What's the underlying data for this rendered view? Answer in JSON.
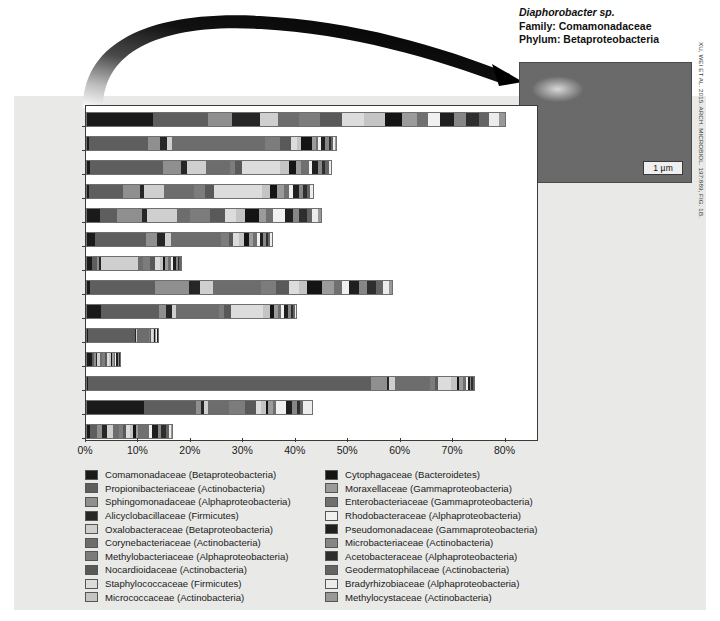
{
  "figure": {
    "callout": {
      "species": "Diaphorobacter sp.",
      "family": "Family: Comamonadaceae",
      "phylum": "Phylum: Betaproteobacteria",
      "scale_bar": "1 µm",
      "credit": "XU, WEI ET AL. 2015. ARCH. MICROBIOL. 197:889, FIG. 1B."
    }
  },
  "chart_data": {
    "type": "bar",
    "orientation": "horizontal",
    "stacked": true,
    "title": "",
    "xlabel": "",
    "ylabel": "",
    "xlim": [
      0,
      86
    ],
    "grid": false,
    "legend_position": "bottom",
    "tick_labels": [
      "0%",
      "10%",
      "20%",
      "30%",
      "40%",
      "50%",
      "60%",
      "70%",
      "80%"
    ],
    "tick_values": [
      0,
      10,
      20,
      30,
      40,
      50,
      60,
      70,
      80
    ],
    "categories": [
      "Indoor air",
      "Bathtub tiles",
      "Carpet",
      "Countertop",
      "Doorstep",
      "Floor",
      "Refrigerator",
      "Outdoor air",
      "Pet",
      "Saliva",
      "Showerhead",
      "Skin",
      "Tap water",
      "Toilet"
    ],
    "series": [
      {
        "name": "Comamonadaceae (Betaproteobacteria)",
        "color": "#1a1a1a",
        "values": [
          12.5,
          0.4,
          0.5,
          0.3,
          2.5,
          1.6,
          1.0,
          0.6,
          2.6,
          0.2,
          1.0,
          0.2,
          10.8,
          0.5
        ]
      },
      {
        "name": "Propionibacteriaceae (Actinobacteria)",
        "color": "#5e5e5e",
        "values": [
          10.6,
          11.2,
          14.0,
          6.6,
          3.3,
          9.6,
          0.9,
          12.3,
          11.1,
          8.9,
          0.4,
          54.0,
          9.9,
          1.5
        ]
      },
      {
        "name": "Sphingomonadaceae (Alphaproteobacteria)",
        "color": "#8f8f8f",
        "values": [
          4.6,
          2.4,
          3.4,
          3.3,
          4.7,
          2.1,
          0.4,
          6.6,
          1.4,
          0.0,
          0.3,
          3.0,
          1.0,
          0.8
        ]
      },
      {
        "name": "Alicyclobacillaceae (Firmicutes)",
        "color": "#262626",
        "values": [
          5.2,
          1.2,
          1.1,
          0.6,
          1.0,
          1.5,
          0.3,
          2.1,
          1.1,
          0.2,
          0.2,
          0.4,
          0.6,
          1.0
        ]
      },
      {
        "name": "Oxalobacteraceae (Betaproteobacteria)",
        "color": "#cfcfcf",
        "values": [
          3.5,
          1.0,
          3.7,
          3.8,
          5.7,
          1.3,
          7.2,
          2.5,
          0.8,
          0.2,
          0.5,
          1.2,
          0.7,
          1.2
        ]
      },
      {
        "name": "Corynebacteriaceae (Actinobacteria)",
        "color": "#6d6d6d",
        "values": [
          4.0,
          17.7,
          4.6,
          5.8,
          2.4,
          9.5,
          0.8,
          9.1,
          8.2,
          2.4,
          0.4,
          6.6,
          4.0,
          1.1
        ]
      },
      {
        "name": "Methylobacteriaceae (Alphaproteobacteria)",
        "color": "#7c7c7c",
        "values": [
          4.1,
          3.0,
          1.0,
          2.2,
          3.8,
          1.4,
          1.4,
          2.9,
          1.0,
          0.2,
          0.6,
          1.0,
          3.2,
          0.8
        ]
      },
      {
        "name": "Nocardioidaceae (Actinobacteria)",
        "color": "#595959",
        "values": [
          4.2,
          2.0,
          1.2,
          1.7,
          2.9,
          0.8,
          0.9,
          2.4,
          1.2,
          0.2,
          0.4,
          0.6,
          2.0,
          0.6
        ]
      },
      {
        "name": "Staphylococcaceae (Firmicutes)",
        "color": "#dcdcdc",
        "values": [
          4.2,
          1.1,
          7.4,
          9.1,
          2.2,
          1.2,
          1.0,
          2.0,
          6.2,
          0.3,
          0.4,
          2.5,
          1.0,
          0.7
        ]
      },
      {
        "name": "Micrococcaceae (Actinobacteria)",
        "color": "#c4c4c4",
        "values": [
          4.0,
          0.8,
          1.7,
          1.6,
          1.6,
          1.0,
          0.6,
          1.4,
          1.3,
          0.2,
          0.3,
          1.0,
          0.9,
          0.5
        ]
      },
      {
        "name": "Cytophagaceae (Bacteroidetes)",
        "color": "#141414",
        "values": [
          3.2,
          2.1,
          1.3,
          1.2,
          2.7,
          0.9,
          0.4,
          3.0,
          0.7,
          0.1,
          0.3,
          0.5,
          0.5,
          0.6
        ]
      },
      {
        "name": "Moraxellaceae (Gammaproteobacteria)",
        "color": "#9b9b9b",
        "values": [
          2.8,
          0.7,
          1.0,
          1.3,
          1.4,
          0.8,
          0.6,
          2.2,
          0.8,
          0.2,
          0.3,
          0.7,
          0.8,
          0.5
        ]
      },
      {
        "name": "Enterobacteriaceae (Gammaproteobacteria)",
        "color": "#707070",
        "values": [
          2.1,
          0.5,
          1.4,
          1.0,
          1.2,
          0.7,
          0.5,
          1.6,
          0.6,
          0.1,
          0.3,
          0.5,
          0.7,
          2.0
        ]
      },
      {
        "name": "Rhodobacteraceae (Alphaproteobacteria)",
        "color": "#f0f0f0",
        "values": [
          2.4,
          0.6,
          0.6,
          0.8,
          2.3,
          0.6,
          0.4,
          1.2,
          0.5,
          0.1,
          0.2,
          0.4,
          1.8,
          0.6
        ]
      },
      {
        "name": "Pseudomonadaceae (Gammaproteobacteria)",
        "color": "#1f1f1f",
        "values": [
          2.6,
          0.8,
          1.1,
          1.1,
          1.6,
          0.6,
          0.5,
          2.0,
          0.9,
          0.2,
          0.3,
          0.4,
          1.2,
          1.1
        ]
      },
      {
        "name": "Microbacteriaceae (Actinobacteria)",
        "color": "#868686",
        "values": [
          2.2,
          0.6,
          0.8,
          0.9,
          1.1,
          0.5,
          0.4,
          1.5,
          0.5,
          0.1,
          0.2,
          0.3,
          0.9,
          0.7
        ]
      },
      {
        "name": "Acetobacteraceae (Alphaproteobacteria)",
        "color": "#2e2e2e",
        "values": [
          2.5,
          0.5,
          0.7,
          0.7,
          1.5,
          0.5,
          0.3,
          1.8,
          0.4,
          0.1,
          0.2,
          0.3,
          0.7,
          0.9
        ]
      },
      {
        "name": "Geodermatophilaceae (Actinobacteria)",
        "color": "#646464",
        "values": [
          2.0,
          0.4,
          0.6,
          0.6,
          1.0,
          0.4,
          0.3,
          1.3,
          0.4,
          0.1,
          0.2,
          0.2,
          0.6,
          0.6
        ]
      },
      {
        "name": "Bradyrhizobiaceae (Alphaproteobacteria)",
        "color": "#ececec",
        "values": [
          1.8,
          0.4,
          0.5,
          0.5,
          1.2,
          0.4,
          0.2,
          1.1,
          0.3,
          0.1,
          0.1,
          0.2,
          1.6,
          0.4
        ]
      },
      {
        "name": "Methylocystaceae (Actinobacteria)",
        "color": "#989898",
        "values": [
          1.5,
          0.4,
          0.4,
          0.4,
          0.9,
          0.3,
          0.2,
          0.9,
          0.3,
          0.1,
          0.1,
          0.2,
          0.4,
          0.4
        ]
      }
    ],
    "totals": [
      80.0,
      47.4,
      47.0,
      43.5,
      45.0,
      35.7,
      18.3,
      58.5,
      40.3,
      14.0,
      6.7,
      74.2,
      43.3,
      16.5
    ]
  }
}
